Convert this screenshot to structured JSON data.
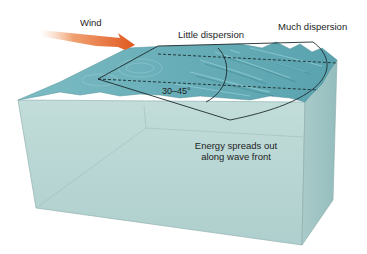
{
  "diagram": {
    "type": "wave-dispersion-block-diagram",
    "labels": {
      "wind": "Wind",
      "little_dispersion": "Little dispersion",
      "much_dispersion": "Much dispersion",
      "angle": "30–45°",
      "energy_line1": "Energy spreads out",
      "energy_line2": "along wave front"
    },
    "colors": {
      "arrow": "#e2622a",
      "water_surface": "#6fb3bd",
      "water_surface_dark": "#4f9aa6",
      "water_body_front": "#b9d8d6",
      "water_body_side": "#a6c9c8",
      "outline": "#2a3a3c",
      "text": "#1e1e1e",
      "background": "#ffffff"
    }
  }
}
